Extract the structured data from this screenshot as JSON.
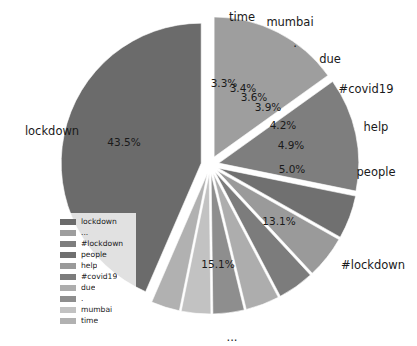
{
  "chart_data": {
    "type": "pie",
    "title": "",
    "labels": [
      "lockdown",
      "...",
      "#lockdown",
      "people",
      "help",
      "#covid19",
      "due",
      ".",
      "mumbai",
      "time"
    ],
    "values": [
      43.5,
      15.1,
      13.1,
      5.0,
      4.9,
      4.2,
      3.9,
      3.6,
      3.4,
      3.3
    ],
    "value_labels": [
      "43.5%",
      "15.1%",
      "13.1%",
      "5.0%",
      "4.9%",
      "4.2%",
      "3.9%",
      "3.6%",
      "3.4%",
      "3.3%"
    ],
    "unit": "%",
    "autopct_format": "%.1f%%",
    "exploded": true,
    "startangle_deg": 90,
    "direction": "counterclockwise",
    "colormap": "grayscale",
    "legend_position": "lower left",
    "grid": false
  },
  "pie": {
    "slices": [
      {
        "name": "lockdown",
        "outer_label": "lockdown",
        "pct_label": "43.5%",
        "value": 43.5,
        "color": "#6b6b6b",
        "outer_label_x": 52,
        "outer_label_y": 131,
        "pct_label_x": 124,
        "pct_label_y": 143
      },
      {
        "name": "time",
        "outer_label": "time",
        "pct_label": "3.3%",
        "value": 3.3,
        "color": "#b1b1b1",
        "outer_label_x": 242,
        "outer_label_y": 17,
        "pct_label_x": 224,
        "pct_label_y": 84
      },
      {
        "name": "mumbai",
        "outer_label": "mumbai",
        "pct_label": "3.4%",
        "value": 3.4,
        "color": "#c2c2c2",
        "outer_label_x": 290,
        "outer_label_y": 22,
        "pct_label_x": 243,
        "pct_label_y": 89
      },
      {
        "name": ".",
        "outer_label": ".",
        "pct_label": "3.6%",
        "value": 3.6,
        "color": "#8e8e8e",
        "outer_label_x": 295,
        "outer_label_y": 43,
        "pct_label_x": 254,
        "pct_label_y": 98
      },
      {
        "name": "due",
        "outer_label": "due",
        "pct_label": "3.9%",
        "value": 3.9,
        "color": "#adadad",
        "outer_label_x": 330,
        "outer_label_y": 59,
        "pct_label_x": 268,
        "pct_label_y": 108
      },
      {
        "name": "#covid19",
        "outer_label": "#covid19",
        "pct_label": "4.2%",
        "value": 4.2,
        "color": "#7c7c7c",
        "outer_label_x": 366,
        "outer_label_y": 89,
        "pct_label_x": 283,
        "pct_label_y": 126
      },
      {
        "name": "help",
        "outer_label": "help",
        "pct_label": "4.9%",
        "value": 4.9,
        "color": "#9a9a9a",
        "outer_label_x": 376,
        "outer_label_y": 127,
        "pct_label_x": 291,
        "pct_label_y": 146
      },
      {
        "name": "people",
        "outer_label": "people",
        "pct_label": "5.0%",
        "value": 5.0,
        "color": "#707070",
        "outer_label_x": 376,
        "outer_label_y": 172,
        "pct_label_x": 292,
        "pct_label_y": 170
      },
      {
        "name": "#lockdown",
        "outer_label": "#lockdown",
        "pct_label": "13.1%",
        "value": 13.1,
        "color": "#7e7e7e",
        "outer_label_x": 373,
        "outer_label_y": 265,
        "pct_label_x": 279,
        "pct_label_y": 222
      },
      {
        "name": "...",
        "outer_label": "...",
        "pct_label": "15.1%",
        "value": 15.1,
        "color": "#9e9e9e",
        "outer_label_x": 232,
        "outer_label_y": 337,
        "pct_label_x": 218,
        "pct_label_y": 265
      }
    ]
  },
  "legend": {
    "items": [
      {
        "label": "lockdown",
        "color": "#6b6b6b"
      },
      {
        "label": "...",
        "color": "#9e9e9e"
      },
      {
        "label": "#lockdown",
        "color": "#7e7e7e"
      },
      {
        "label": "people",
        "color": "#707070"
      },
      {
        "label": "help",
        "color": "#9a9a9a"
      },
      {
        "label": "#covid19",
        "color": "#7c7c7c"
      },
      {
        "label": "due",
        "color": "#adadad"
      },
      {
        "label": ".",
        "color": "#8e8e8e"
      },
      {
        "label": "mumbai",
        "color": "#c2c2c2"
      },
      {
        "label": "time",
        "color": "#b1b1b1"
      }
    ]
  }
}
